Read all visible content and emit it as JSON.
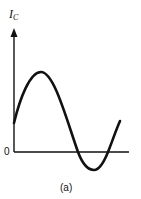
{
  "figure": {
    "y_axis_label": "I",
    "y_axis_label_subscript": "C",
    "origin_label": "0",
    "caption": "(a)",
    "curve": "sinusoid offset",
    "colors": {
      "stroke": "#111111",
      "background": "#ffffff"
    }
  }
}
